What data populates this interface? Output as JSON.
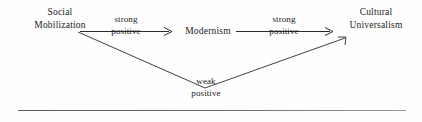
{
  "diagram": {
    "type": "causal-path-diagram",
    "nodes": [
      {
        "id": "social-mobilization",
        "line1": "Social",
        "line2": "Mobilization"
      },
      {
        "id": "modernism",
        "line1": "Modernism",
        "line2": ""
      },
      {
        "id": "cultural-universalism",
        "line1": "Cultural",
        "line2": "Universalism"
      }
    ],
    "edges": [
      {
        "id": "sm-to-mod",
        "from": "social-mobilization",
        "to": "modernism",
        "strength": "strong",
        "direction": "positive",
        "shape": "straight"
      },
      {
        "id": "mod-to-cu",
        "from": "modernism",
        "to": "cultural-universalism",
        "strength": "strong",
        "direction": "positive",
        "shape": "straight"
      },
      {
        "id": "sm-to-cu",
        "from": "social-mobilization",
        "to": "cultural-universalism",
        "strength": "weak",
        "direction": "positive",
        "shape": "bent-v"
      }
    ],
    "colors": {
      "ink": "#1a1a1a",
      "stroke": "#2b2b2b",
      "rule": "#6a6a6a",
      "background": "#fefefe"
    }
  }
}
